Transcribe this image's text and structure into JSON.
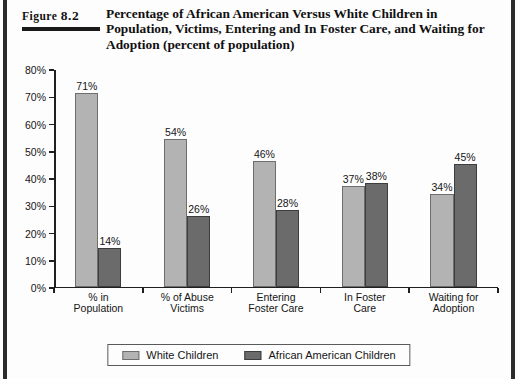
{
  "figure": {
    "label_word": "Figure",
    "label_number": "8.2",
    "title": "Percentage of African American Versus White Children in Population, Victims, Entering and In Foster Care, and Waiting for Adoption (percent of population)"
  },
  "legend": {
    "white_children": "White Children",
    "african_american_children": "African American Children"
  },
  "colors": {
    "white_children": "#b3b3b3",
    "african_american_children": "#6b6b6b",
    "axis": "#1f1f1f",
    "background": "#fdfdfd"
  },
  "chart_data": {
    "type": "bar",
    "title": "Percentage of African American Versus White Children in Population, Victims, Entering and In Foster Care, and Waiting for Adoption (percent of population)",
    "xlabel": "",
    "ylabel": "",
    "ylim": [
      0,
      80
    ],
    "ytick_labels": [
      "0%",
      "10%",
      "20%",
      "30%",
      "40%",
      "50%",
      "60%",
      "70%",
      "80%"
    ],
    "ytick_values": [
      0,
      10,
      20,
      30,
      40,
      50,
      60,
      70,
      80
    ],
    "grid": false,
    "legend_position": "bottom",
    "categories": [
      "% in Population",
      "% of Abuse Victims",
      "Entering Foster Care",
      "In Foster Care",
      "Waiting for Adoption"
    ],
    "category_lines": [
      [
        "% in",
        "Population"
      ],
      [
        "% of Abuse",
        "Victims"
      ],
      [
        "Entering",
        "Foster Care"
      ],
      [
        "In Foster",
        "Care"
      ],
      [
        "Waiting for",
        "Adoption"
      ]
    ],
    "series": [
      {
        "name": "White Children",
        "color": "#b3b3b3",
        "values": [
          71,
          54,
          46,
          37,
          34
        ],
        "labels": [
          "71%",
          "54%",
          "46%",
          "37%",
          "34%"
        ]
      },
      {
        "name": "African American Children",
        "color": "#6b6b6b",
        "values": [
          14,
          26,
          28,
          38,
          45
        ],
        "labels": [
          "14%",
          "26%",
          "28%",
          "38%",
          "45%"
        ]
      }
    ]
  }
}
